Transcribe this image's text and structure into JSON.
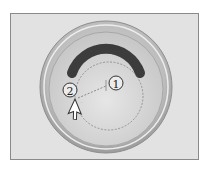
{
  "figure": {
    "type": "instructional-diagram",
    "callouts": [
      {
        "id": "callout-1",
        "label": "1"
      },
      {
        "id": "callout-2",
        "label": "2"
      }
    ],
    "cursor_hint": "...",
    "colors": {
      "frame_background": "#e2e2e2",
      "frame_border": "#8a8a8a",
      "outer_rim": "#b8b8b8",
      "inner_dish": "#d6d6d6",
      "arc": "#3c3c3c",
      "guide_line": "#666666"
    }
  }
}
